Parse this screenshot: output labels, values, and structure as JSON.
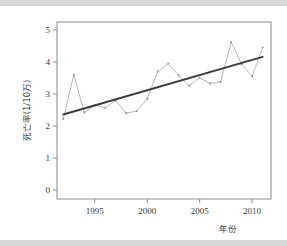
{
  "figure": {
    "background_color": "#ffffff",
    "band_color": "#d8d8d8",
    "frame_color": "#8a8a8a"
  },
  "chart_data": {
    "type": "line",
    "title": "",
    "subtitle": "",
    "xlabel": "年份",
    "ylabel": "死亡率(1/10万)",
    "xlim": [
      1991.4,
      2011.8
    ],
    "ylim": [
      -0.28,
      5.25
    ],
    "xticks": [
      1995,
      2000,
      2005,
      2010
    ],
    "xtick_labels": [
      "1995",
      "2000",
      "2005",
      "2010"
    ],
    "yticks": [
      0,
      1,
      2,
      3,
      4,
      5
    ],
    "ytick_labels": [
      "0",
      "1",
      "2",
      "3",
      "4",
      "5"
    ],
    "grid": false,
    "legend": null,
    "legend_position": "none",
    "x": [
      1992,
      1993,
      1994,
      1995,
      1996,
      1997,
      1998,
      1999,
      2000,
      2001,
      2002,
      2003,
      2004,
      2005,
      2006,
      2007,
      2008,
      2009,
      2010,
      2011
    ],
    "series": [
      {
        "name": "死亡率",
        "type": "line-markers",
        "color": "#b9b9b9",
        "marker": "point",
        "values": [
          2.22,
          3.6,
          2.42,
          2.65,
          2.57,
          2.8,
          2.4,
          2.47,
          2.85,
          3.7,
          3.95,
          3.58,
          3.26,
          3.5,
          3.33,
          3.38,
          4.62,
          3.93,
          3.55,
          4.45
        ]
      },
      {
        "name": "趋势线",
        "type": "trend-line",
        "color": "#3b3b3b",
        "values": [
          2.36,
          2.45,
          2.55,
          2.64,
          2.74,
          2.83,
          2.93,
          3.02,
          3.12,
          3.21,
          3.31,
          3.4,
          3.5,
          3.59,
          3.69,
          3.78,
          3.88,
          3.97,
          4.07,
          4.16
        ]
      }
    ]
  }
}
